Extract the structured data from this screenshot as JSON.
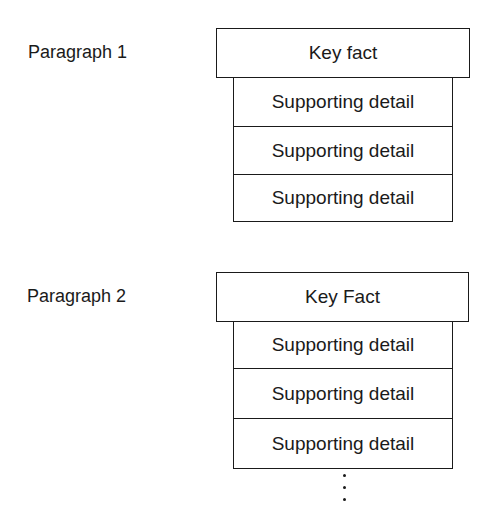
{
  "groups": [
    {
      "label": "Paragraph 1",
      "key_fact": "Key fact",
      "details": [
        "Supporting detail",
        "Supporting detail",
        "Supporting detail"
      ]
    },
    {
      "label": "Paragraph 2",
      "key_fact": "Key Fact",
      "details": [
        "Supporting detail",
        "Supporting detail",
        "Supporting detail"
      ],
      "continuation": "⋮"
    }
  ]
}
